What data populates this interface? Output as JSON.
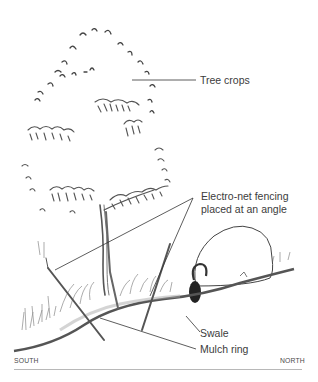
{
  "diagram": {
    "labels": {
      "tree_crops": "Tree crops",
      "fencing_line1": "Electro-net fencing",
      "fencing_line2": "placed at an angle",
      "swale": "Swale",
      "mulch_ring": "Mulch ring"
    },
    "compass": {
      "left": "SOUTH",
      "right": "NORTH"
    },
    "colors": {
      "ink": "#3a3a3a",
      "ground": "#555555",
      "rule": "#b8b8b8",
      "background": "#ffffff"
    },
    "icons": [
      "tree-sketch",
      "sheep-sketch",
      "fence-post",
      "grass-tufts"
    ]
  }
}
